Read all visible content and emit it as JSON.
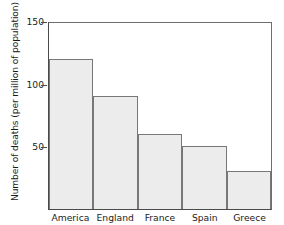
{
  "chart_data": {
    "type": "bar",
    "title": "",
    "xlabel": "",
    "ylabel": "Number of deaths (per million of population)",
    "categories": [
      "America",
      "England",
      "France",
      "Spain",
      "Greece"
    ],
    "values": [
      120,
      90,
      60,
      50,
      30
    ],
    "ylim": [
      0,
      150
    ],
    "yticks": [
      150,
      100,
      50
    ],
    "ytick_labels": [
      "150",
      "100",
      "50"
    ],
    "grid": false,
    "legend": null,
    "bar_fill_color": "#ececec",
    "bar_edge_color": "#777777",
    "axis_color": "#4a4a4a",
    "background_color": "#ffffff"
  },
  "axes": {
    "y_title": "Number of deaths (per million of population)",
    "y_ticks": [
      {
        "label": "150",
        "value": 150
      },
      {
        "label": "100",
        "value": 100
      },
      {
        "label": "50",
        "value": 50
      }
    ]
  },
  "bars": [
    {
      "label": "America",
      "value": 120
    },
    {
      "label": "England",
      "value": 90
    },
    {
      "label": "France",
      "value": 60
    },
    {
      "label": "Spain",
      "value": 50
    },
    {
      "label": "Greece",
      "value": 30
    }
  ]
}
